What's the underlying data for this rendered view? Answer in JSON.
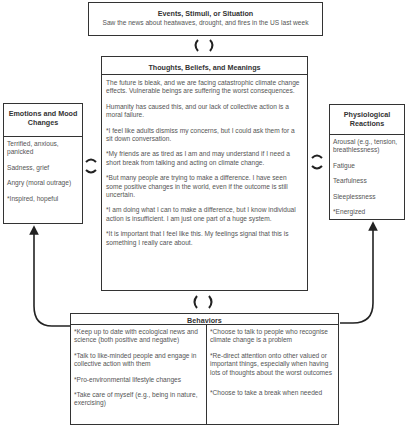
{
  "events": {
    "title": "Events, Stimuli, or Situation",
    "text": "Saw the news about heatwaves, drought, and fires in the US last week"
  },
  "thoughts": {
    "title": "Thoughts, Beliefs, and Meanings",
    "items": [
      "The future is bleak, and we are facing catastrophic climate change effects. Vulnerable beings are suffering the worst consequences.",
      "Humanity has caused this, and our lack of collective action is a moral failure.",
      "*I feel like adults dismiss my concerns, but I could ask them for a sit down conversation.",
      "*My friends are as tired as I am and may understand if I need a short break from talking and acting on climate change.",
      "*But many people are trying to make a difference. I have seen some positive changes in the world, even if the outcome is still uncertain.",
      "*I am doing what I can to make a difference, but I know individual action is insufficient. I am just one part of a huge system.",
      "*It is important that I feel like this. My feelings signal that this is something I really care about."
    ]
  },
  "emotions": {
    "title": "Emotions and Mood Changes",
    "items": [
      "Terrified, anxious, panicked",
      "Sadness, grief",
      "Angry (moral outrage)",
      "*Inspired, hopeful"
    ]
  },
  "physiological": {
    "title": "Physiological Reactions",
    "items": [
      "Arousal (e.g., tension, breathlessness)",
      "Fatigue",
      "Tearfulness",
      "Sleeplessness",
      "*Energized"
    ]
  },
  "behaviors": {
    "title": "Behaviors",
    "left": [
      "*Keep up to date with ecological news and science (both positive and negative)",
      "*Talk to like-minded people and engage in collective action with them",
      "*Pro-environmental lifestyle changes",
      "*Take care of myself (e.g., being in nature, exercising)"
    ],
    "right": [
      "*Choose to talk to people who recognise climate change is a problem",
      "*Re-direct attention onto other valued or important things, especially when having lots of thoughts about the worst outcomes",
      "*Choose to take a break when needed"
    ]
  },
  "connectors": {
    "events_thoughts": "bidirectional-cycle-icon",
    "thoughts_behaviors": "bidirectional-cycle-icon",
    "emotions_thoughts": "bidirectional-cycle-icon",
    "thoughts_physiological": "bidirectional-cycle-icon",
    "behaviors_to_emotions": "arrow-up",
    "behaviors_to_physiological": "arrow-up"
  },
  "colors": {
    "border": "#333333",
    "text": "#555555",
    "heading": "#333333"
  }
}
